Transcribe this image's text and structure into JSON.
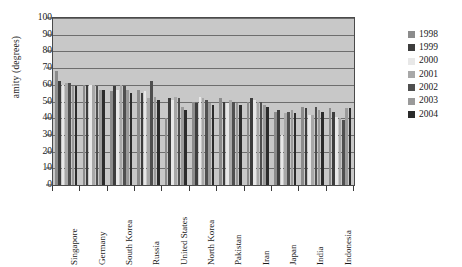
{
  "chart_data": {
    "type": "bar",
    "title": "",
    "xlabel": "",
    "ylabel": "amity (degrees)",
    "ylim": [
      0,
      100
    ],
    "ytick_step": 10,
    "yticks": [
      100,
      90,
      80,
      70,
      60,
      50,
      40,
      30,
      20,
      10,
      0
    ],
    "grid": true,
    "legend_position": "right",
    "categories": [
      "Singapore",
      "Germany",
      "South Korea",
      "Russia",
      "United States",
      "North Korea",
      "Pakistan",
      "Iran",
      "Japan",
      "India",
      "Indonesia"
    ],
    "series": [
      {
        "name": "1998",
        "color": "#8c8c8c",
        "values": [
          68,
          60,
          56,
          57,
          40,
          50,
          52,
          50,
          44,
          47,
          46
        ]
      },
      {
        "name": "1999",
        "color": "#3d3d3d",
        "values": [
          62,
          60,
          59,
          55,
          52,
          49,
          50,
          52,
          45,
          46,
          44
        ]
      },
      {
        "name": "2000",
        "color": "#e8e8e8",
        "values": [
          60,
          60,
          57,
          56,
          51,
          53,
          49,
          51,
          30,
          42,
          41
        ]
      },
      {
        "name": "2001",
        "color": "#a8a8a8",
        "values": [
          61,
          60,
          60,
          52,
          53,
          52,
          51,
          50,
          43,
          42,
          40
        ]
      },
      {
        "name": "2002",
        "color": "#4f4f4f",
        "values": [
          61,
          59,
          59,
          62,
          52,
          51,
          50,
          50,
          44,
          47,
          39
        ]
      },
      {
        "name": "2003",
        "color": "#9a9a9a",
        "values": [
          59,
          57,
          57,
          53,
          47,
          49,
          49,
          48,
          45,
          45,
          46
        ]
      },
      {
        "name": "2004",
        "color": "#2b2b2b",
        "values": [
          59,
          57,
          55,
          51,
          45,
          48,
          48,
          47,
          43,
          44,
          46
        ]
      }
    ]
  },
  "legend": {
    "items": [
      {
        "label": "1998"
      },
      {
        "label": "1999"
      },
      {
        "label": "2000"
      },
      {
        "label": "2001"
      },
      {
        "label": "2002"
      },
      {
        "label": "2003"
      },
      {
        "label": "2004"
      }
    ]
  }
}
